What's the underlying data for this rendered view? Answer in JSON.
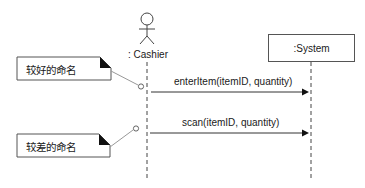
{
  "diagram": {
    "type": "UML sequence diagram",
    "actor": {
      "label": ": Cashier"
    },
    "system": {
      "label": ":System"
    },
    "messages": [
      {
        "label": "enterItem(itemID, quantity)",
        "from": ": Cashier",
        "to": ":System"
      },
      {
        "label": "scan(itemID, quantity)",
        "from": ": Cashier",
        "to": ":System"
      }
    ],
    "notes": [
      {
        "text": "较好的命名",
        "attached_to_message": 0
      },
      {
        "text": "较差的命名",
        "attached_to_message": 1
      }
    ],
    "colors": {
      "line": "#333333",
      "note_connector": "#999999",
      "background": "#ffffff"
    }
  }
}
